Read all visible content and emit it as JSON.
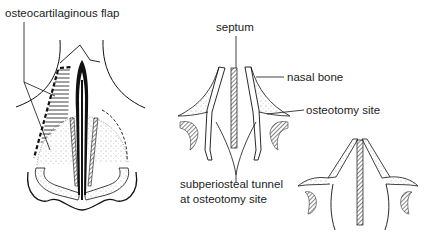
{
  "diagram": {
    "type": "medical-illustration",
    "panels": [
      {
        "id": "left",
        "description": "frontal view of nose with osteocartilaginous flap"
      },
      {
        "id": "middle",
        "description": "cross-section before osteotomy"
      },
      {
        "id": "right",
        "description": "cross-section after osteotomy / infracture"
      }
    ],
    "labels": {
      "flap": "osteocartilaginous flap",
      "septum": "septum",
      "nasal_bone": "nasal bone",
      "osteotomy_site": "osteotomy site",
      "tunnel_line1": "subperiosteal tunnel",
      "tunnel_line2": "at osteotomy site"
    },
    "colors": {
      "ink": "#111111",
      "background": "#ffffff"
    }
  }
}
